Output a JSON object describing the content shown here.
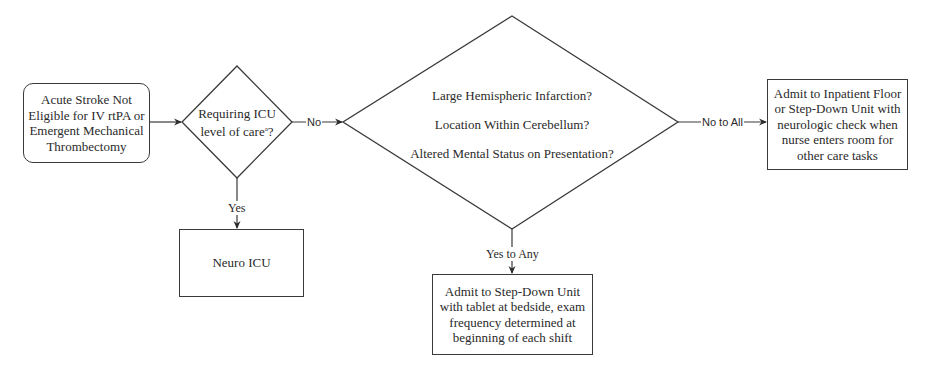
{
  "flowchart": {
    "start": {
      "lines": [
        "Acute Stroke Not",
        "Eligible for IV rtPA or",
        "Emergent Mechanical",
        "Thrombectomy"
      ]
    },
    "decision_icu": {
      "line1": "Requiring ICU",
      "line2_prefix": "level of care",
      "footnote": "a",
      "line2_suffix": "?"
    },
    "decision_criteria": {
      "questions": [
        "Large Hemispheric Infarction?",
        "Location Within Cerebellum?",
        "Altered Mental Status on Presentation?"
      ]
    },
    "outcome_floor": {
      "lines": [
        "Admit to Inpatient Floor",
        "or Step-Down Unit with",
        "neurologic check when",
        "nurse enters room for",
        "other care tasks"
      ]
    },
    "outcome_icu": {
      "label": "Neuro ICU"
    },
    "outcome_stepdown": {
      "lines": [
        "Admit to Step-Down Unit",
        "with tablet at bedside, exam",
        "frequency determined at",
        "beginning of each shift"
      ]
    },
    "edge_labels": {
      "icu_no": "No",
      "icu_yes": "Yes",
      "criteria_no": "No to All",
      "criteria_yes": "Yes to Any"
    },
    "colors": {
      "stroke": "#3a3a3a",
      "text": "#2a2a2a",
      "background": "#ffffff"
    }
  }
}
